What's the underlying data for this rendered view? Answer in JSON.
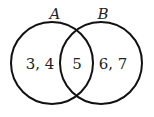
{
  "diagram": {
    "type": "venn",
    "sets": [
      {
        "name": "A",
        "only_elements": "3, 4"
      },
      {
        "name": "B",
        "only_elements": "6, 7"
      }
    ],
    "intersection": "5",
    "stroke_color": "#111111"
  }
}
